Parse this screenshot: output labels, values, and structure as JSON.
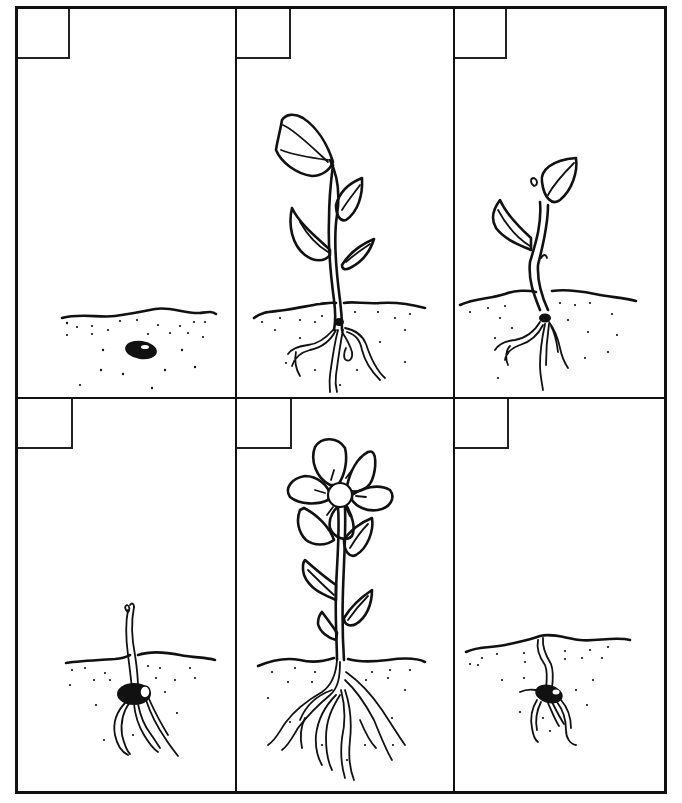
{
  "worksheet": {
    "title": "",
    "layout": {
      "rows": 2,
      "columns": 3
    },
    "colors": {
      "ink": "#111111",
      "paper": "#ffffff"
    },
    "panels": [
      {
        "id": "panel-1",
        "row": 1,
        "col": 1,
        "stage": "seed-in-soil",
        "number_box": ""
      },
      {
        "id": "panel-2",
        "row": 1,
        "col": 2,
        "stage": "budding-plant",
        "number_box": ""
      },
      {
        "id": "panel-3",
        "row": 1,
        "col": 3,
        "stage": "seedling-with-leaves",
        "number_box": ""
      },
      {
        "id": "panel-4",
        "row": 2,
        "col": 1,
        "stage": "sprout-emerging",
        "number_box": ""
      },
      {
        "id": "panel-5",
        "row": 2,
        "col": 2,
        "stage": "flowering-plant",
        "number_box": ""
      },
      {
        "id": "panel-6",
        "row": 2,
        "col": 3,
        "stage": "germinating-seed",
        "number_box": ""
      }
    ]
  }
}
